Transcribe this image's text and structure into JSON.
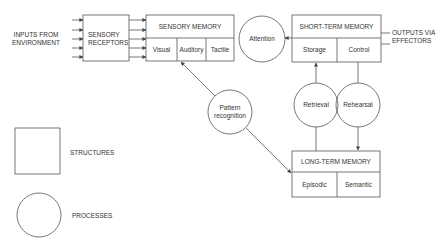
{
  "inputs_label": [
    "INPUTS FROM",
    "ENVIRONMENT"
  ],
  "outputs_label": [
    "OUTPUTS VIA",
    "EFFECTORS"
  ],
  "structures": {
    "sensory_receptors": [
      "SENSORY",
      "RECEPTORS"
    ],
    "sensory_memory": {
      "title": "SENSORY MEMORY",
      "parts": [
        "Visual",
        "Auditory",
        "Tactile"
      ]
    },
    "short_term_memory": {
      "title": "SHORT-TERM MEMORY",
      "parts": [
        "Storage",
        "Control"
      ]
    },
    "long_term_memory": {
      "title": "LONG-TERM MEMORY",
      "parts": [
        "Episodic",
        "Semantic"
      ]
    }
  },
  "processes": {
    "attention": "Attention",
    "pattern_recognition": [
      "Pattern",
      "recognition"
    ],
    "retrieval": "Retrieval",
    "rehearsal": "Rehearsal"
  },
  "legend": {
    "structures": "STRUCTURES",
    "processes": "PROCESSES"
  },
  "colors": {
    "line": "#555555",
    "text": "#333333",
    "background": "#ffffff"
  }
}
